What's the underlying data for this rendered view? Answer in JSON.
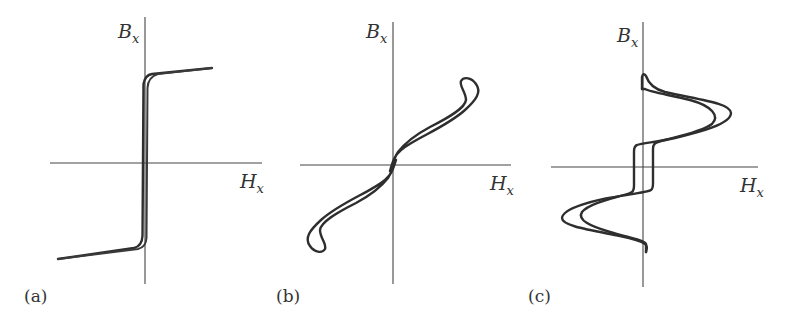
{
  "figure": {
    "panels": [
      {
        "id": "a",
        "label": "(a)",
        "y_axis": {
          "symbol": "B",
          "subscript": "x"
        },
        "x_axis": {
          "symbol": "H",
          "subscript": "x"
        },
        "shape": "square loop with near-vertical switching at H≈0 and sloped saturation branches"
      },
      {
        "id": "b",
        "label": "(b)",
        "y_axis": {
          "symbol": "B",
          "subscript": "x"
        },
        "x_axis": {
          "symbol": "H",
          "subscript": "x"
        },
        "shape": "narrow S-shaped loop through origin with hooked ends"
      },
      {
        "id": "c",
        "label": "(c)",
        "y_axis": {
          "symbol": "B",
          "subscript": "x"
        },
        "x_axis": {
          "symbol": "H",
          "subscript": "x"
        },
        "shape": "loop with central rectangular step and large lobes in upper-right and lower-left"
      }
    ],
    "colors": {
      "line": "#2e2e2e",
      "axis": "#444444",
      "background": "#ffffff"
    }
  }
}
